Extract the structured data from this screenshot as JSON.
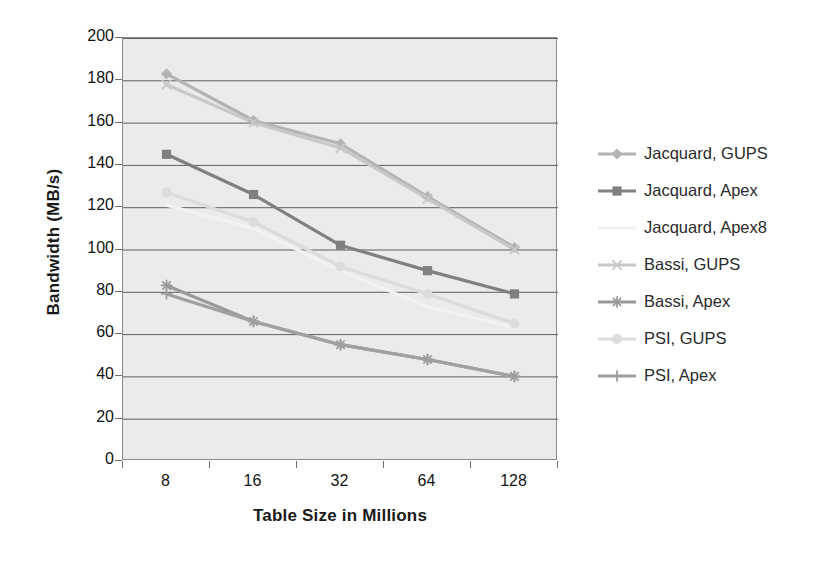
{
  "chart_data": {
    "type": "line",
    "title": "",
    "xlabel": "Table Size in Millions",
    "ylabel": "Bandwidth (MB/s)",
    "categories": [
      "8",
      "16",
      "32",
      "64",
      "128"
    ],
    "x": [
      8,
      16,
      32,
      64,
      128
    ],
    "xticklabels": [
      "8",
      "16",
      "32",
      "64",
      "128"
    ],
    "yticklabels": [
      "0",
      "20",
      "40",
      "60",
      "80",
      "100",
      "120",
      "140",
      "160",
      "180",
      "200"
    ],
    "ylim": [
      0,
      200
    ],
    "ytick_step": 20,
    "grid": "horizontal",
    "legend_position": "right",
    "plot_background": "#ebebeb",
    "series": [
      {
        "name": "Jacquard, GUPS",
        "marker": "diamond",
        "color": "#b4b4b4",
        "values": [
          183,
          161,
          150,
          125,
          101
        ]
      },
      {
        "name": "Jacquard, Apex",
        "marker": "square",
        "color": "#808080",
        "values": [
          145,
          126,
          102,
          90,
          79
        ]
      },
      {
        "name": "Jacquard, Apex8",
        "marker": "none",
        "color": "#f2f2f2",
        "values": [
          121,
          110,
          90,
          73,
          63
        ]
      },
      {
        "name": "Bassi, GUPS",
        "marker": "x",
        "color": "#c8c8c8",
        "values": [
          178,
          160,
          148,
          124,
          100
        ]
      },
      {
        "name": "Bassi, Apex",
        "marker": "asterisk",
        "color": "#9a9a9a",
        "values": [
          83,
          66,
          55,
          48,
          40
        ]
      },
      {
        "name": "PSI, GUPS",
        "marker": "circle",
        "color": "#dcdcdc",
        "values": [
          127,
          113,
          92,
          79,
          65
        ]
      },
      {
        "name": "PSI, Apex",
        "marker": "plus",
        "color": "#a0a0a0",
        "values": [
          79,
          66,
          55,
          48,
          40
        ]
      }
    ]
  },
  "legend": {
    "items": [
      {
        "label": "Jacquard, GUPS"
      },
      {
        "label": "Jacquard, Apex"
      },
      {
        "label": "Jacquard, Apex8"
      },
      {
        "label": "Bassi, GUPS"
      },
      {
        "label": "Bassi, Apex"
      },
      {
        "label": "PSI, GUPS"
      },
      {
        "label": "PSI, Apex"
      }
    ]
  }
}
